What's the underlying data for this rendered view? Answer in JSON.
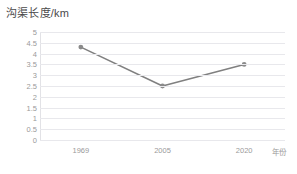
{
  "chart_data": {
    "type": "line",
    "title": "沟渠长度/km",
    "xlabel": "年份",
    "ylabel": "",
    "categories": [
      "1969",
      "2005",
      "2020"
    ],
    "values": [
      4.3,
      2.5,
      3.5
    ],
    "series": [
      {
        "name": "沟渠长度",
        "values": [
          4.3,
          2.5,
          3.5
        ]
      }
    ],
    "ylim": [
      0,
      5
    ],
    "ytick_step": 0.5,
    "yticks": [
      "5",
      "4.5",
      "4",
      "3.5",
      "3",
      "2.5",
      "2",
      "1.5",
      "1",
      "0.5",
      "0"
    ],
    "grid": true,
    "legend": "none",
    "line_color": "#808080",
    "marker_color": "#8a8a8a",
    "grid_color": "#e8e8ec",
    "tick_label_color": "#9a9a9a",
    "title_color": "#4a4a4a",
    "background": "#ffffff"
  }
}
